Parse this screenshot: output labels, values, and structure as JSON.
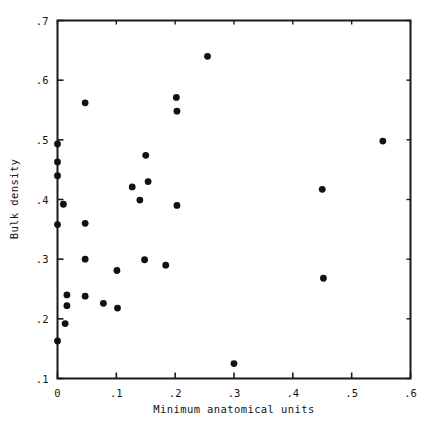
{
  "chart_data": {
    "type": "scatter",
    "title": "",
    "xlabel": "Minimum anatomical units",
    "ylabel": "Bulk density",
    "xlim": [
      0,
      0.6
    ],
    "ylim": [
      0.1,
      0.7
    ],
    "xticks": [
      0,
      0.1,
      0.2,
      0.3,
      0.4,
      0.5,
      0.6
    ],
    "xtick_labels": [
      "0",
      ".1",
      ".2",
      ".3",
      ".4",
      ".5",
      ".6"
    ],
    "yticks": [
      0.1,
      0.2,
      0.3,
      0.4,
      0.5,
      0.6,
      0.7
    ],
    "ytick_labels": [
      ".1",
      ".2",
      ".3",
      ".4",
      ".5",
      ".6",
      ".7"
    ],
    "grid": false,
    "legend": null,
    "marker": "filled-circle",
    "marker_color": "#111111",
    "points": [
      {
        "x": 0.0,
        "y": 0.493
      },
      {
        "x": 0.0,
        "y": 0.463
      },
      {
        "x": 0.0,
        "y": 0.44
      },
      {
        "x": 0.0,
        "y": 0.358
      },
      {
        "x": 0.0,
        "y": 0.163
      },
      {
        "x": 0.01,
        "y": 0.392
      },
      {
        "x": 0.013,
        "y": 0.192
      },
      {
        "x": 0.016,
        "y": 0.24
      },
      {
        "x": 0.016,
        "y": 0.222
      },
      {
        "x": 0.047,
        "y": 0.562
      },
      {
        "x": 0.047,
        "y": 0.36
      },
      {
        "x": 0.047,
        "y": 0.3
      },
      {
        "x": 0.047,
        "y": 0.238
      },
      {
        "x": 0.078,
        "y": 0.226
      },
      {
        "x": 0.101,
        "y": 0.281
      },
      {
        "x": 0.102,
        "y": 0.218
      },
      {
        "x": 0.127,
        "y": 0.421
      },
      {
        "x": 0.14,
        "y": 0.399
      },
      {
        "x": 0.15,
        "y": 0.474
      },
      {
        "x": 0.154,
        "y": 0.43
      },
      {
        "x": 0.148,
        "y": 0.299
      },
      {
        "x": 0.184,
        "y": 0.29
      },
      {
        "x": 0.202,
        "y": 0.571
      },
      {
        "x": 0.203,
        "y": 0.548
      },
      {
        "x": 0.203,
        "y": 0.39
      },
      {
        "x": 0.255,
        "y": 0.64
      },
      {
        "x": 0.3,
        "y": 0.125
      },
      {
        "x": 0.45,
        "y": 0.417
      },
      {
        "x": 0.452,
        "y": 0.268
      },
      {
        "x": 0.553,
        "y": 0.498
      }
    ]
  },
  "axes": {
    "x_title": "Minimum anatomical units",
    "y_title": "Bulk density"
  }
}
